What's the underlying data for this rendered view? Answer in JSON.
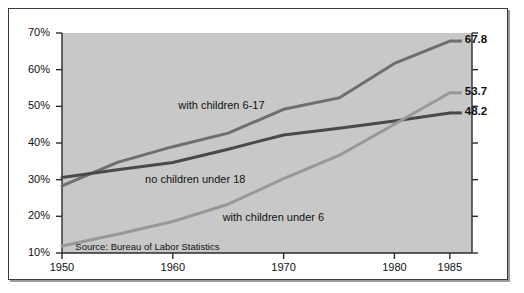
{
  "figure": {
    "background": "#ffffff",
    "plot_background": "#c8c8c8",
    "frame_color": "#3a3a3a"
  },
  "source_note": "Source:  Bureau of Labor Statistics",
  "chart_data": {
    "type": "line",
    "title": "",
    "subtitle": "",
    "xlabel": "",
    "ylabel": "",
    "xlim": [
      1950,
      1987
    ],
    "ylim": [
      10,
      70
    ],
    "yticks": [
      10,
      20,
      30,
      40,
      50,
      60,
      70
    ],
    "ytick_labels": [
      "10%",
      "20%",
      "30%",
      "40%",
      "50%",
      "60%",
      "70%"
    ],
    "xticks": [
      1950,
      1960,
      1970,
      1980,
      1985
    ],
    "xtick_labels": [
      "1950",
      "1960",
      "1970",
      "1980",
      "1985"
    ],
    "grid": false,
    "legend_position": "inline-annotations",
    "series": [
      {
        "name": "with children 6-17",
        "label": "with children 6-17",
        "color": "#6e6e6e",
        "width": 3.0,
        "end_value_label": "67.8",
        "x": [
          1950,
          1955,
          1960,
          1965,
          1970,
          1975,
          1980,
          1985
        ],
        "values": [
          28.3,
          34.7,
          39.0,
          42.7,
          49.2,
          52.3,
          61.7,
          67.8
        ]
      },
      {
        "name": "no children under 18",
        "label": "no children under 18",
        "color": "#4a4a4a",
        "width": 3.0,
        "end_value_label": "48.2",
        "x": [
          1950,
          1955,
          1960,
          1965,
          1970,
          1975,
          1980,
          1985
        ],
        "values": [
          30.6,
          32.7,
          34.7,
          38.3,
          42.2,
          44.0,
          46.0,
          48.2
        ]
      },
      {
        "name": "with children under 6",
        "label": "with children under 6",
        "color": "#989898",
        "width": 3.0,
        "end_value_label": "53.7",
        "x": [
          1950,
          1955,
          1960,
          1965,
          1970,
          1975,
          1980,
          1985
        ],
        "values": [
          11.9,
          15.1,
          18.6,
          23.3,
          30.3,
          36.6,
          45.1,
          53.7
        ]
      }
    ],
    "annotations": [
      {
        "text": "with children 6-17",
        "x": 1960.5,
        "y": 50.2
      },
      {
        "text": "no children under 18",
        "x": 1957.5,
        "y": 29.8
      },
      {
        "text": "with children under 6",
        "x": 1964.5,
        "y": 19.5
      },
      {
        "text": "Source:  Bureau of Labor Statistics",
        "x": 1951.2,
        "y": 11.3
      }
    ]
  }
}
